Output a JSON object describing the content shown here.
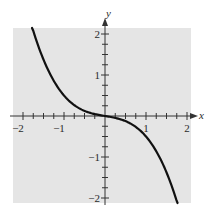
{
  "chart_data": {
    "type": "line",
    "title": "",
    "xlabel": "x",
    "ylabel": "y",
    "xlim": [
      -2.2,
      2.1
    ],
    "ylim": [
      -2.12,
      2.15
    ],
    "grid": false,
    "legend": "none",
    "background_color": "#e5e5e5",
    "curve_color": "#111111",
    "axis_color": "#333333",
    "x_major_ticks": [
      -2,
      -1,
      1,
      2
    ],
    "x_tick_labels": [
      "−2",
      "−1",
      "1",
      "2"
    ],
    "y_major_ticks": [
      2,
      1,
      -1,
      -2
    ],
    "y_tick_labels": [
      "2",
      "1",
      "−1",
      "−2"
    ],
    "minor_tick_step": 0.25,
    "series": [
      {
        "name": "curve",
        "expression": "y = -x^3/3 - x/6",
        "x": [
          -1.78,
          -1.75,
          -1.5,
          -1.25,
          -1.0,
          -0.75,
          -0.5,
          -0.25,
          0,
          0.25,
          0.5,
          0.75,
          1.0,
          1.25,
          1.5,
          1.75,
          1.77
        ],
        "y": [
          2.176,
          2.078,
          1.375,
          0.859,
          0.5,
          0.266,
          0.125,
          0.047,
          0,
          -0.047,
          -0.125,
          -0.266,
          -0.5,
          -0.859,
          -1.375,
          -2.078,
          -2.144
        ]
      }
    ]
  }
}
